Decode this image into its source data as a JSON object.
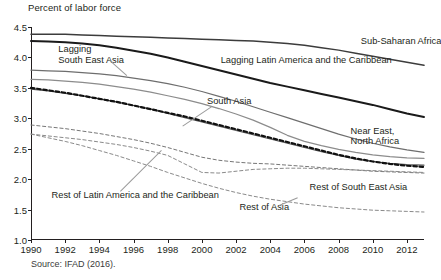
{
  "header": {
    "axis_title": "Percent of labor force"
  },
  "footer": {
    "source": "Source: IFAD (2016)."
  },
  "chart_data": {
    "type": "line",
    "title": "",
    "subtitle": "",
    "xlabel": "",
    "ylabel": "Percent of labor force",
    "ylim": [
      1.0,
      4.5
    ],
    "xlim": [
      1990,
      2013
    ],
    "grid": false,
    "legend_position": "inline-annotations",
    "ytick_labels": [
      "1.0",
      "1.5",
      "2.0",
      "2.5",
      "3.0",
      "3.5",
      "4.0",
      "4.5"
    ],
    "ytick_values": [
      1.0,
      1.5,
      2.0,
      2.5,
      3.0,
      3.5,
      4.0,
      4.5
    ],
    "xtick_labels": [
      "1990",
      "1992",
      "1994",
      "1996",
      "1998",
      "2000",
      "2002",
      "2004",
      "2006",
      "2008",
      "2010",
      "2012"
    ],
    "xtick_values": [
      1990,
      1992,
      1994,
      1996,
      1998,
      2000,
      2002,
      2004,
      2006,
      2008,
      2010,
      2012
    ],
    "x": [
      1990,
      1991,
      1992,
      1993,
      1994,
      1995,
      1996,
      1997,
      1998,
      1999,
      2000,
      2001,
      2002,
      2003,
      2004,
      2005,
      2006,
      2007,
      2008,
      2009,
      2010,
      2011,
      2012,
      2013
    ],
    "series": [
      {
        "name": "Sub-Saharan Africa",
        "style": "solid",
        "color": "#3c3c3c",
        "width": 1.5,
        "label_x": 2009.3,
        "label_y": 4.26,
        "values": [
          4.38,
          4.38,
          4.38,
          4.37,
          4.36,
          4.35,
          4.34,
          4.33,
          4.32,
          4.31,
          4.3,
          4.29,
          4.28,
          4.27,
          4.25,
          4.23,
          4.2,
          4.16,
          4.12,
          4.07,
          4.02,
          3.97,
          3.92,
          3.87
        ]
      },
      {
        "name": "Lagging Latin America and the Caribbean",
        "style": "solid",
        "color": "#1a1a1a",
        "width": 2.0,
        "label_x": 2001.1,
        "label_y": 3.94,
        "values": [
          4.27,
          4.26,
          4.25,
          4.23,
          4.2,
          4.16,
          4.11,
          4.06,
          4.0,
          3.93,
          3.86,
          3.79,
          3.72,
          3.65,
          3.58,
          3.52,
          3.46,
          3.4,
          3.34,
          3.28,
          3.22,
          3.15,
          3.08,
          3.02
        ]
      },
      {
        "name": "Lagging South East Asia",
        "style": "solid",
        "color": "#6e6e6e",
        "width": 1.2,
        "label_x": 1992.0,
        "label_y": 4.08,
        "values": [
          3.79,
          3.78,
          3.77,
          3.75,
          3.73,
          3.7,
          3.66,
          3.62,
          3.57,
          3.51,
          3.44,
          3.36,
          3.28,
          3.19,
          3.1,
          3.01,
          2.92,
          2.83,
          2.74,
          2.66,
          2.59,
          2.53,
          2.48,
          2.44
        ]
      },
      {
        "name": "South Asia",
        "style": "solid",
        "color": "#8c8c8c",
        "width": 1.2,
        "label_x": 2000.2,
        "label_y": 3.24,
        "values": [
          3.64,
          3.63,
          3.61,
          3.59,
          3.56,
          3.52,
          3.48,
          3.43,
          3.37,
          3.31,
          3.24,
          3.16,
          3.07,
          2.97,
          2.85,
          2.72,
          2.62,
          2.55,
          2.49,
          2.44,
          2.4,
          2.37,
          2.35,
          2.34
        ]
      },
      {
        "name": "Near East, North Africa",
        "style": "solid",
        "color": "#5a5a5a",
        "width": 1.2,
        "label_x": 2008.6,
        "label_y": 2.74,
        "values": [
          3.48,
          3.45,
          3.41,
          3.37,
          3.32,
          3.27,
          3.21,
          3.15,
          3.08,
          3.01,
          2.94,
          2.87,
          2.8,
          2.73,
          2.66,
          2.59,
          2.52,
          2.45,
          2.39,
          2.33,
          2.29,
          2.26,
          2.24,
          2.23
        ]
      },
      {
        "name": "World (thick dashed)",
        "style": "dashed-thick",
        "color": "#111111",
        "width": 2.2,
        "label_x": null,
        "label_y": null,
        "values": [
          3.5,
          3.46,
          3.42,
          3.37,
          3.32,
          3.27,
          3.21,
          3.15,
          3.09,
          3.03,
          2.96,
          2.89,
          2.82,
          2.75,
          2.68,
          2.61,
          2.54,
          2.47,
          2.4,
          2.34,
          2.29,
          2.25,
          2.22,
          2.2
        ]
      },
      {
        "name": "Rest of South East Asia",
        "style": "dashed",
        "color": "#777777",
        "width": 1.0,
        "label_x": 2006.4,
        "label_y": 1.85,
        "values": [
          2.89,
          2.86,
          2.83,
          2.79,
          2.75,
          2.7,
          2.65,
          2.59,
          2.52,
          2.44,
          2.36,
          2.31,
          2.28,
          2.26,
          2.25,
          2.23,
          2.21,
          2.19,
          2.17,
          2.15,
          2.13,
          2.12,
          2.11,
          2.1
        ]
      },
      {
        "name": "Rest of Latin America and the Caribbean",
        "style": "dashed",
        "color": "#8a8a8a",
        "width": 1.0,
        "label_x": 1991.2,
        "label_y": 1.71,
        "values": [
          2.74,
          2.71,
          2.68,
          2.65,
          2.61,
          2.57,
          2.52,
          2.46,
          2.39,
          2.25,
          2.11,
          2.1,
          2.13,
          2.16,
          2.17,
          2.18,
          2.18,
          2.17,
          2.16,
          2.15,
          2.14,
          2.13,
          2.12,
          2.11
        ]
      },
      {
        "name": "Rest of Asia",
        "style": "dashed",
        "color": "#8a8a8a",
        "width": 1.0,
        "label_x": 2002.1,
        "label_y": 1.52,
        "values": [
          2.74,
          2.68,
          2.62,
          2.55,
          2.47,
          2.39,
          2.3,
          2.21,
          2.11,
          2.02,
          1.93,
          1.85,
          1.78,
          1.72,
          1.67,
          1.63,
          1.59,
          1.56,
          1.53,
          1.51,
          1.49,
          1.48,
          1.47,
          1.46
        ]
      }
    ],
    "annotations": [
      {
        "text": "Sub-Saharan Africa",
        "x": 2009.3,
        "y": 4.26
      },
      {
        "text": "Lagging\nSouth East Asia",
        "x": 1991.6,
        "y": 4.12
      },
      {
        "text": "Lagging Latin America and the Caribbean",
        "x": 2001.1,
        "y": 3.94
      },
      {
        "text": "South Asia",
        "x": 2000.3,
        "y": 3.26
      },
      {
        "text": "Near East,\nNorth Africa",
        "x": 2008.7,
        "y": 2.78
      },
      {
        "text": "Rest of South East Asia",
        "x": 2006.3,
        "y": 1.86
      },
      {
        "text": "Rest of Latin America and the Caribbean",
        "x": 1991.2,
        "y": 1.72
      },
      {
        "text": "Rest of Asia",
        "x": 2002.2,
        "y": 1.52
      }
    ]
  }
}
